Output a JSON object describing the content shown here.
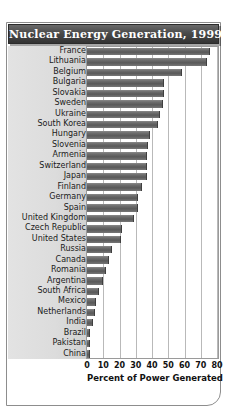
{
  "chart_data": {
    "type": "bar",
    "orientation": "horizontal",
    "title": "Nuclear Energy Generation, 1999",
    "xlabel": "Percent of Power Generated",
    "ylabel": "",
    "xlim": [
      0,
      80
    ],
    "xticks": [
      0,
      10,
      20,
      30,
      40,
      50,
      60,
      70,
      80
    ],
    "grid": true,
    "legend": null,
    "categories": [
      "France",
      "Lithuania",
      "Belgium",
      "Bulgaria",
      "Slovakia",
      "Sweden",
      "Ukraine",
      "South Korea",
      "Hungary",
      "Slovenia",
      "Armenia",
      "Switzerland",
      "Japan",
      "Finland",
      "Germany",
      "Spain",
      "United Kingdom",
      "Czech Republic",
      "United States",
      "Russia",
      "Canada",
      "Romania",
      "Argentina",
      "South Africa",
      "Mexico",
      "Netherlands",
      "India",
      "Brazil",
      "Pakistan",
      "China"
    ],
    "values": [
      75,
      73,
      58,
      47,
      47,
      46,
      44,
      43,
      38,
      37,
      36,
      36,
      36,
      33,
      31,
      31,
      28,
      21,
      20,
      15,
      13,
      11,
      9,
      7,
      5,
      4,
      3,
      1,
      1,
      1
    ],
    "bar_color": "#5f5f5f"
  },
  "axis": {
    "tick_labels": [
      "0",
      "10",
      "20",
      "30",
      "40",
      "50",
      "60",
      "70",
      "80"
    ],
    "x_axis_label": "Percent of Power Generated"
  },
  "header": {
    "title": "Nuclear Energy Generation, 1999"
  }
}
